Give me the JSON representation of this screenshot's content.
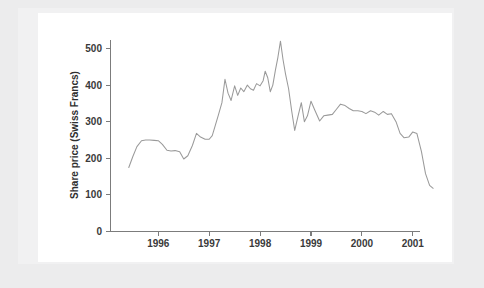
{
  "figure": {
    "background_color": "#ffffff",
    "page_color": "#ececed",
    "line_color": "#9a9a9a",
    "axis_color": "#7c7c7c",
    "text_color": "#3a3a3a"
  },
  "chart_data": {
    "type": "line",
    "title": "",
    "xlabel": "",
    "ylabel": "Share price (Swiss Francs)",
    "xlim": [
      1995.42,
      2001.5
    ],
    "ylim": [
      0,
      540
    ],
    "grid": false,
    "legend": null,
    "xticks": [
      1996,
      1997,
      1998,
      1999,
      2000,
      2001
    ],
    "xtick_labels": [
      "1996",
      "1997",
      "1998",
      "1999",
      "2000",
      "2001"
    ],
    "yticks": [
      0,
      100,
      200,
      300,
      400,
      500
    ],
    "ytick_labels": [
      "0",
      "100",
      "200",
      "300",
      "400",
      "500"
    ],
    "series": [
      {
        "name": "Share price",
        "x": [
          1995.42,
          1995.5,
          1995.58,
          1995.67,
          1995.75,
          1995.83,
          1995.92,
          1996.0,
          1996.08,
          1996.17,
          1996.25,
          1996.33,
          1996.42,
          1996.5,
          1996.58,
          1996.67,
          1996.75,
          1996.83,
          1996.92,
          1997.0,
          1997.06,
          1997.12,
          1997.18,
          1997.25,
          1997.31,
          1997.37,
          1997.43,
          1997.5,
          1997.56,
          1997.62,
          1997.68,
          1997.75,
          1997.81,
          1997.87,
          1997.93,
          1998.0,
          1998.06,
          1998.1,
          1998.15,
          1998.2,
          1998.25,
          1998.3,
          1998.35,
          1998.4,
          1998.45,
          1998.5,
          1998.56,
          1998.62,
          1998.68,
          1998.75,
          1998.81,
          1998.87,
          1998.93,
          1999.0,
          1999.08,
          1999.17,
          1999.25,
          1999.33,
          1999.42,
          1999.5,
          1999.58,
          1999.67,
          1999.75,
          1999.83,
          1999.92,
          2000.0,
          2000.08,
          2000.17,
          2000.25,
          2000.33,
          2000.42,
          2000.5,
          2000.58,
          2000.67,
          2000.75,
          2000.83,
          2000.92,
          2001.0,
          2001.08,
          2001.17,
          2001.25,
          2001.33,
          2001.4
        ],
        "y": [
          175,
          205,
          232,
          248,
          250,
          250,
          249,
          248,
          238,
          222,
          220,
          221,
          218,
          198,
          207,
          235,
          268,
          258,
          252,
          252,
          262,
          290,
          318,
          352,
          416,
          378,
          358,
          398,
          372,
          392,
          382,
          400,
          390,
          386,
          404,
          398,
          412,
          438,
          420,
          382,
          400,
          440,
          476,
          520,
          470,
          430,
          390,
          330,
          276,
          318,
          352,
          300,
          316,
          356,
          330,
          302,
          316,
          318,
          320,
          334,
          348,
          344,
          336,
          330,
          330,
          328,
          322,
          330,
          326,
          318,
          328,
          320,
          322,
          300,
          268,
          256,
          258,
          272,
          268,
          218,
          158,
          126,
          118
        ]
      }
    ],
    "annotations": []
  }
}
